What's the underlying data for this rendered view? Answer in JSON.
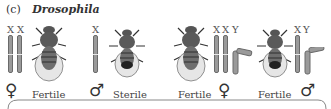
{
  "title": {
    "label": "(c)",
    "genus": "Drosophila"
  },
  "groups": [
    {
      "chromosomes": "X X",
      "letters": [
        "X",
        "X"
      ],
      "sex_symbol": "♀",
      "sex": "female",
      "fertility": "Fertile"
    },
    {
      "chromosomes": "X",
      "letters": [
        "X"
      ],
      "sex_symbol": "♂",
      "sex": "male",
      "fertility": "Sterile"
    },
    {
      "chromosomes": "X X Y",
      "letters": [
        "X",
        "X",
        "Y"
      ],
      "sex_symbol": "♀",
      "sex": "female",
      "fertility": "Fertile"
    },
    {
      "chromosomes": "X Y",
      "letters": [
        "X",
        "Y"
      ],
      "sex_symbol": "♂",
      "sex": "male",
      "fertility": "Fertile"
    }
  ],
  "colors": {
    "chromosome": "#9a9a9a",
    "chromosome_outline": "#6a6a6a",
    "text": "#3a3a3a",
    "fly": "#4a4a4a"
  }
}
